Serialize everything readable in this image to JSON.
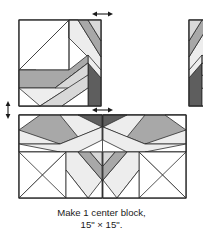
{
  "figure": {
    "kind": "quilt-block-assembly-diagram",
    "caption": {
      "line1": "Make 1 center block,",
      "line2": "15\" × 15\"."
    },
    "colors": {
      "outline": "#2b2b2b",
      "background": "#ffffff",
      "fabric_white": "#ffffff",
      "fabric_light": "#ededed",
      "fabric_medium_light": "#d8d8d8",
      "fabric_medium": "#a8a8a8",
      "fabric_dark": "#8a8a8a",
      "fabric_darkest": "#5e5e5e",
      "arrow": "#1a1a1a",
      "caption_text": "#1a1a1a"
    },
    "blocks": [
      {
        "name": "top-left-block",
        "position": "top-left",
        "x": 19,
        "y": 20,
        "width": 82,
        "height": 86
      },
      {
        "name": "top-right-block",
        "position": "top-right",
        "x": 104,
        "y": 20,
        "width": 82,
        "height": 86
      },
      {
        "name": "bottom-block",
        "position": "bottom",
        "x": 19,
        "y": 115,
        "width": 167,
        "height": 83
      }
    ],
    "arrows": [
      {
        "name": "seam-arrow-top-center",
        "orientation": "horizontal",
        "cx": 102,
        "cy": 14,
        "length": 17
      },
      {
        "name": "seam-arrow-left-center",
        "orientation": "vertical",
        "cx": 8,
        "cy": 110,
        "length": 17
      },
      {
        "name": "seam-arrow-bottom-center",
        "orientation": "horizontal",
        "cx": 102,
        "cy": 110,
        "length": 17
      }
    ]
  }
}
